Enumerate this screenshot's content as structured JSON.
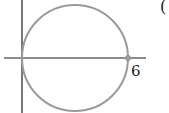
{
  "figure": {
    "x_intercept_label": "6",
    "partial_label": "(",
    "colors": {
      "axis": "#1a1a1a",
      "circle": "#9a9a9a",
      "point": "#9a9a9a",
      "text": "#222222"
    }
  }
}
